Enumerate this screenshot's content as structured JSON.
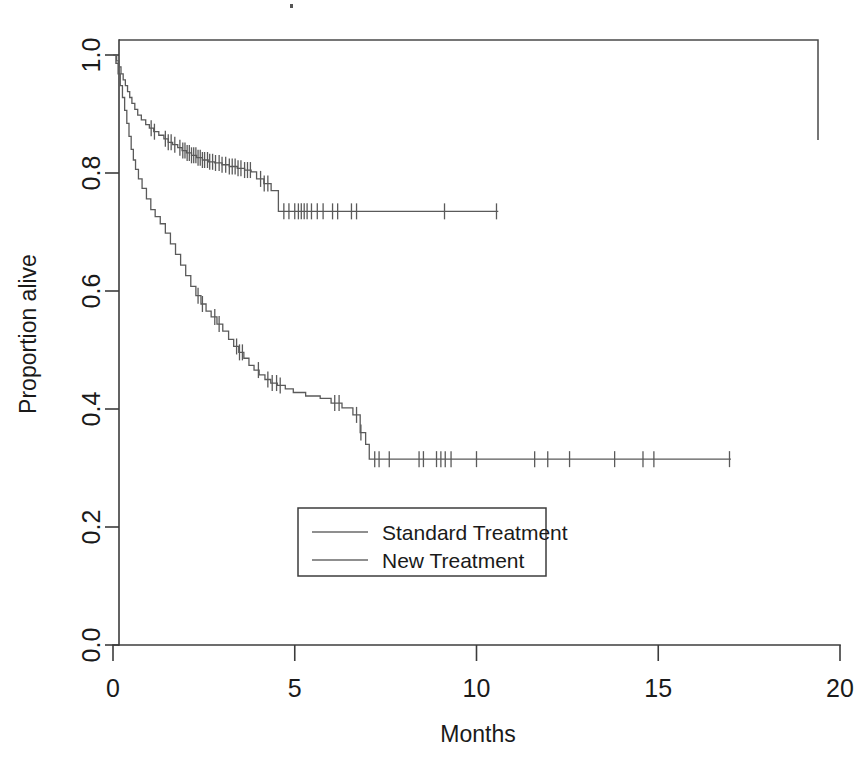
{
  "figure": {
    "kind": "kaplan-meier-survival-plot",
    "background": "#ffffff",
    "line_color": "#5a5a5a",
    "axis_color": "#3c3c3c",
    "text_color": "#1a1a1a"
  },
  "chart_data": {
    "type": "line",
    "title": "",
    "subtitle": "",
    "xlabel": "Months",
    "ylabel": "Proportion alive",
    "xlim": [
      0,
      20
    ],
    "ylim": [
      0,
      1.0
    ],
    "xticks": [
      0,
      5,
      10,
      15,
      20
    ],
    "xticklabels": [
      "0",
      "5",
      "10",
      "15",
      "20"
    ],
    "yticks": [
      0.0,
      0.2,
      0.4,
      0.6,
      0.8,
      1.0
    ],
    "yticklabels": [
      "0.0",
      "0.2",
      "0.4",
      "0.6",
      "0.8",
      "1.0"
    ],
    "grid": false,
    "legend_position": "center",
    "step_style": "post",
    "series": [
      {
        "name": "Standard Treatment",
        "final_survival": 0.735,
        "last_followup_months": 10.6,
        "steps": [
          [
            0.0,
            1.0
          ],
          [
            0.1,
            0.99
          ],
          [
            0.16,
            0.98
          ],
          [
            0.22,
            0.968
          ],
          [
            0.28,
            0.958
          ],
          [
            0.34,
            0.948
          ],
          [
            0.4,
            0.938
          ],
          [
            0.46,
            0.928
          ],
          [
            0.52,
            0.918
          ],
          [
            0.6,
            0.908
          ],
          [
            0.68,
            0.898
          ],
          [
            0.78,
            0.89
          ],
          [
            0.9,
            0.882
          ],
          [
            1.0,
            0.876
          ],
          [
            1.12,
            0.87
          ],
          [
            1.26,
            0.864
          ],
          [
            1.4,
            0.858
          ],
          [
            1.52,
            0.852
          ],
          [
            1.64,
            0.848
          ],
          [
            1.78,
            0.843
          ],
          [
            1.9,
            0.838
          ],
          [
            2.02,
            0.834
          ],
          [
            2.16,
            0.83
          ],
          [
            2.3,
            0.826
          ],
          [
            2.46,
            0.822
          ],
          [
            2.62,
            0.819
          ],
          [
            2.8,
            0.817
          ],
          [
            3.0,
            0.814
          ],
          [
            3.2,
            0.811
          ],
          [
            3.42,
            0.808
          ],
          [
            3.62,
            0.805
          ],
          [
            3.8,
            0.802
          ],
          [
            3.95,
            0.79
          ],
          [
            4.15,
            0.782
          ],
          [
            4.35,
            0.77
          ],
          [
            4.55,
            0.735
          ],
          [
            10.6,
            0.735
          ]
        ],
        "censor_times": [
          1.05,
          1.14,
          1.44,
          1.52,
          1.6,
          1.7,
          1.84,
          1.92,
          1.98,
          2.04,
          2.1,
          2.16,
          2.22,
          2.28,
          2.34,
          2.4,
          2.46,
          2.52,
          2.6,
          2.66,
          2.74,
          2.82,
          2.92,
          3.0,
          3.1,
          3.2,
          3.28,
          3.36,
          3.44,
          3.52,
          3.62,
          3.7,
          3.78,
          4.06,
          4.16,
          4.26,
          4.7,
          4.84,
          5.0,
          5.1,
          5.18,
          5.26,
          5.34,
          5.46,
          5.62,
          5.78,
          6.04,
          6.18,
          6.56,
          6.7,
          9.12,
          10.55
        ]
      },
      {
        "name": "New Treatment",
        "final_survival": 0.315,
        "last_followup_months": 17.0,
        "steps": [
          [
            0.0,
            1.0
          ],
          [
            0.08,
            0.986
          ],
          [
            0.14,
            0.968
          ],
          [
            0.2,
            0.948
          ],
          [
            0.26,
            0.928
          ],
          [
            0.32,
            0.906
          ],
          [
            0.38,
            0.884
          ],
          [
            0.44,
            0.862
          ],
          [
            0.5,
            0.84
          ],
          [
            0.56,
            0.822
          ],
          [
            0.62,
            0.806
          ],
          [
            0.7,
            0.79
          ],
          [
            0.8,
            0.774
          ],
          [
            0.92,
            0.756
          ],
          [
            1.04,
            0.738
          ],
          [
            1.16,
            0.726
          ],
          [
            1.3,
            0.714
          ],
          [
            1.44,
            0.698
          ],
          [
            1.58,
            0.68
          ],
          [
            1.72,
            0.662
          ],
          [
            1.86,
            0.644
          ],
          [
            2.0,
            0.626
          ],
          [
            2.14,
            0.608
          ],
          [
            2.28,
            0.592
          ],
          [
            2.42,
            0.578
          ],
          [
            2.56,
            0.566
          ],
          [
            2.7,
            0.556
          ],
          [
            2.86,
            0.544
          ],
          [
            3.02,
            0.532
          ],
          [
            3.18,
            0.518
          ],
          [
            3.32,
            0.506
          ],
          [
            3.46,
            0.496
          ],
          [
            3.6,
            0.486
          ],
          [
            3.74,
            0.474
          ],
          [
            3.88,
            0.466
          ],
          [
            4.02,
            0.458
          ],
          [
            4.18,
            0.45
          ],
          [
            4.34,
            0.444
          ],
          [
            4.52,
            0.44
          ],
          [
            4.74,
            0.434
          ],
          [
            4.96,
            0.428
          ],
          [
            5.3,
            0.422
          ],
          [
            5.7,
            0.418
          ],
          [
            6.0,
            0.41
          ],
          [
            6.3,
            0.402
          ],
          [
            6.6,
            0.39
          ],
          [
            6.8,
            0.36
          ],
          [
            6.95,
            0.34
          ],
          [
            7.05,
            0.315
          ],
          [
            17.0,
            0.315
          ]
        ],
        "censor_times": [
          2.34,
          2.46,
          2.8,
          2.92,
          3.4,
          3.48,
          3.56,
          4.0,
          4.26,
          4.38,
          4.5,
          4.6,
          6.1,
          6.22,
          6.7,
          6.82,
          7.2,
          7.32,
          7.6,
          8.42,
          8.54,
          8.9,
          9.02,
          9.14,
          9.3,
          10.0,
          11.6,
          11.96,
          12.56,
          13.8,
          14.58,
          14.88,
          16.96
        ]
      }
    ],
    "legend": [
      {
        "label": "Standard Treatment"
      },
      {
        "label": "New Treatment"
      }
    ]
  }
}
